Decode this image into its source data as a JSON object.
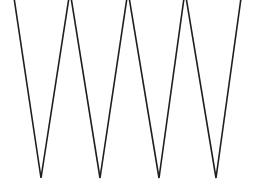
{
  "figure": {
    "type": "line-drawing",
    "canvas": {
      "width": 260,
      "height": 179,
      "background_color": "#ffffff"
    },
    "line": {
      "name": "zigzag-polyline",
      "stroke_color": "#1f1f1f",
      "stroke_width": 1.6,
      "fill": "none",
      "cap": "butt",
      "join": "miter"
    },
    "geometry": {
      "description": "Continuous W-shaped zigzag of four downward spikes; apexes are clipped above the top edge of the canvas.",
      "peak_count": 5,
      "valley_count": 4,
      "peak_y": -9,
      "valley_y": 178,
      "peaks_x": [
        13,
        70,
        128,
        185,
        242
      ],
      "valleys_x": [
        41,
        100,
        159,
        216
      ],
      "points": "13,-9 41,178 70,-9 100,178 128,-9 159,178 185,-9 216,178 242,-9",
      "clipped_top": true,
      "clipped_bottom": true
    }
  }
}
